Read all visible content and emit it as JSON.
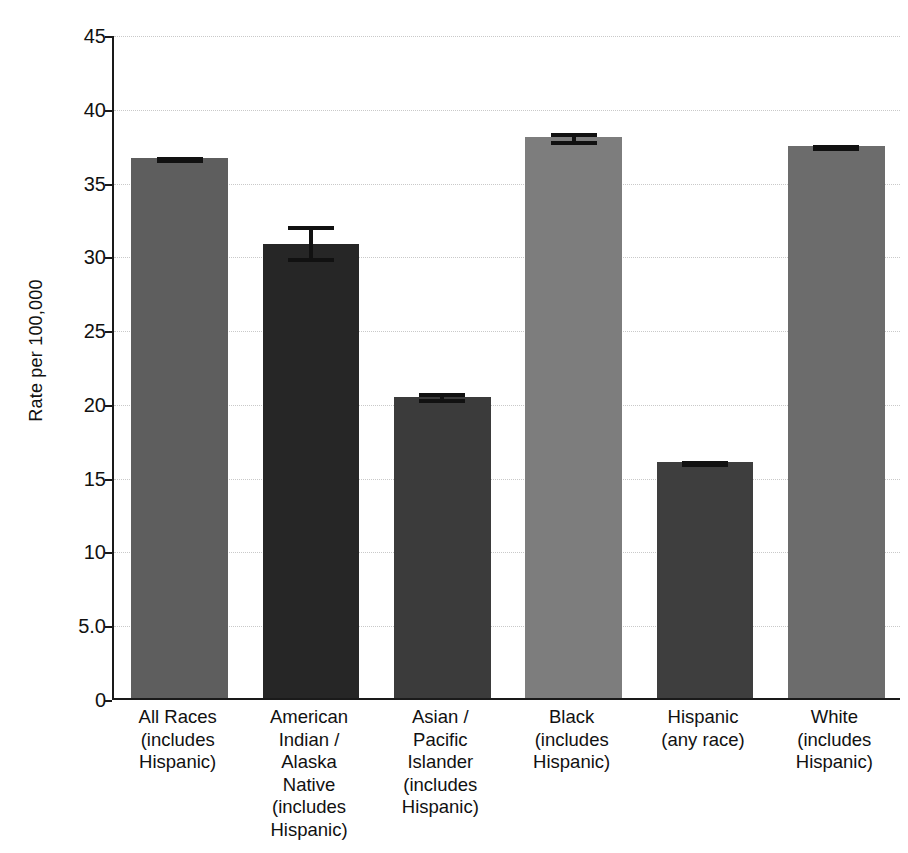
{
  "chart_data": {
    "type": "bar",
    "title": "",
    "subtitle": "",
    "xlabel": "",
    "ylabel": "Rate per 100,000",
    "ylim": [
      0,
      45
    ],
    "grid": true,
    "legend": "none",
    "y_ticks": [
      "0",
      "5.0",
      "10",
      "15",
      "20",
      "25",
      "30",
      "35",
      "40",
      "45"
    ],
    "y_tick_values": [
      0,
      5,
      10,
      15,
      20,
      25,
      30,
      35,
      40,
      45
    ],
    "categories": [
      "All Races\n(includes\nHispanic)",
      "American\nIndian /\nAlaska\nNative\n(includes\nHispanic)",
      "Asian /\nPacific\nIslander\n(includes\nHispanic)",
      "Black\n(includes\nHispanic)",
      "Hispanic\n(any race)",
      "White\n(includes\nHispanic)"
    ],
    "values": [
      36.6,
      30.8,
      20.4,
      38.0,
      16.0,
      37.4
    ],
    "error_low": [
      36.4,
      29.7,
      20.1,
      37.6,
      15.8,
      37.2
    ],
    "error_high": [
      36.8,
      32.1,
      20.8,
      38.4,
      16.2,
      37.6
    ],
    "bar_colors": [
      "#5e5e5e",
      "#262626",
      "#3b3b3b",
      "#7d7d7d",
      "#3e3e3e",
      "#6c6c6c"
    ],
    "error_color": "#111111",
    "axis_color": "#1a1a1a",
    "grid_color": "#c9c9c9",
    "background": "#ffffff"
  }
}
